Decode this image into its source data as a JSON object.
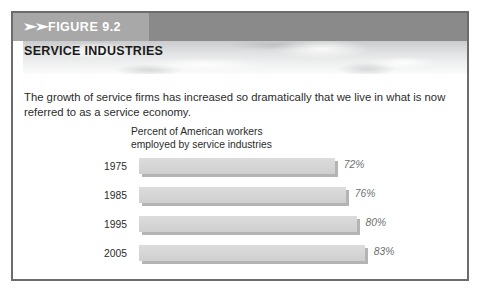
{
  "figure": {
    "tag_chevrons": "➤➤",
    "tag_label": "FIGURE 9.2",
    "section_title": "SERVICE INDUSTRIES",
    "intro_text": "The growth of service firms has increased so dramatically that we live in what is now referred to as a service economy."
  },
  "colors": {
    "frame_border": "#6c6c6c",
    "header_band": "#8a8a8a",
    "figure_tag_bg": "#a8a8a8",
    "bar_fill": "#d5d5d5",
    "bar_shadow": "#b4b4b4",
    "value_label": "#6f6f6f"
  },
  "chart_data": {
    "type": "bar",
    "orientation": "horizontal",
    "title": "Percent of American workers employed by service industries",
    "title_line1": "Percent of American workers",
    "title_line2": "employed by service industries",
    "xlabel": "",
    "ylabel": "",
    "categories": [
      "1975",
      "1985",
      "1995",
      "2005"
    ],
    "values": [
      72,
      76,
      80,
      83
    ],
    "value_labels": [
      "72%",
      "76%",
      "80%",
      "83%"
    ],
    "xlim": [
      0,
      100
    ],
    "grid": false,
    "legend": false
  }
}
